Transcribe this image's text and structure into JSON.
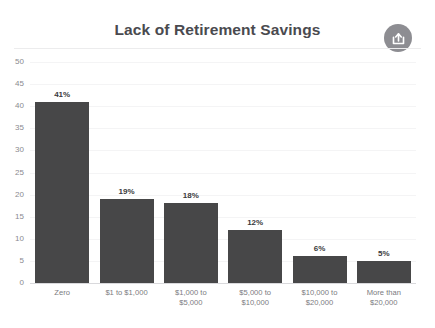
{
  "header": {
    "title": "Lack of Retirement Savings",
    "share_icon": "share-export-icon",
    "share_label": "Share"
  },
  "colors": {
    "bar": "#474748",
    "title_text": "#4a4a4f",
    "tick_text": "#8a8a8f",
    "gridline": "#f4f4f5",
    "axis_line": "#d9d9dc",
    "share_circle": "#8d8d92",
    "background": "#ffffff"
  },
  "chart_data": {
    "type": "bar",
    "title": "Lack of Retirement Savings",
    "xlabel": "",
    "ylabel": "",
    "ylim": [
      0,
      50
    ],
    "yticks": [
      0,
      5,
      10,
      15,
      20,
      25,
      30,
      35,
      40,
      45,
      50
    ],
    "grid": true,
    "legend": false,
    "categories": [
      "Zero",
      "$1 to $1,000",
      "$1,000 to\n$5,000",
      "$5,000 to\n$10,000",
      "$10,000 to\n$20,000",
      "More than\n$20,000"
    ],
    "category_lines": [
      [
        "Zero"
      ],
      [
        "$1 to $1,000"
      ],
      [
        "$1,000 to",
        "$5,000"
      ],
      [
        "$5,000 to",
        "$10,000"
      ],
      [
        "$10,000 to",
        "$20,000"
      ],
      [
        "More than",
        "$20,000"
      ]
    ],
    "values": [
      41,
      19,
      18,
      12,
      6,
      5
    ],
    "data_labels": [
      "41%",
      "19%",
      "18%",
      "12%",
      "6%",
      "5%"
    ]
  }
}
